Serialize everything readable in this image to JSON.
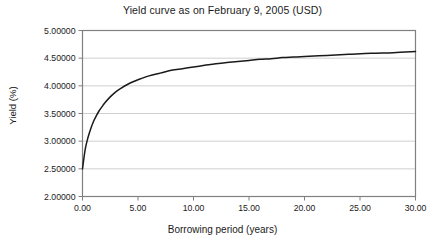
{
  "chart_data": {
    "type": "line",
    "title": "Yield curve as on February 9, 2005 (USD)",
    "xlabel": "Borrowing period (years)",
    "ylabel": "Yield (%)",
    "xlim": [
      0.0,
      30.0
    ],
    "ylim": [
      2.0,
      5.0
    ],
    "xticks": [
      0.0,
      5.0,
      10.0,
      15.0,
      20.0,
      25.0,
      30.0
    ],
    "xtick_labels": [
      "0.00",
      "5.00",
      "10.00",
      "15.00",
      "20.00",
      "25.00",
      "30.00"
    ],
    "yticks": [
      2.0,
      2.5,
      3.0,
      3.5,
      4.0,
      4.5,
      5.0
    ],
    "ytick_labels": [
      "2.00000",
      "2.50000",
      "3.00000",
      "3.50000",
      "4.00000",
      "4.50000",
      "5.00000"
    ],
    "grid": "horizontal",
    "legend": "none",
    "line_color": "#1a1a1a",
    "grid_color": "#cfcfcf",
    "axis_color": "#808080",
    "background_color": "#ffffff",
    "series": [
      {
        "name": "Yield curve",
        "x": [
          0.0,
          0.25,
          0.5,
          0.75,
          1.0,
          1.25,
          1.5,
          1.75,
          2.0,
          2.5,
          3.0,
          3.5,
          4.0,
          4.5,
          5.0,
          6.0,
          7.0,
          8.0,
          9.0,
          10.0,
          11.0,
          12.0,
          13.0,
          14.0,
          15.0,
          16.0,
          17.0,
          18.0,
          19.0,
          20.0,
          22.0,
          24.0,
          26.0,
          28.0,
          30.0
        ],
        "y": [
          2.5,
          2.86,
          3.07,
          3.23,
          3.36,
          3.46,
          3.55,
          3.62,
          3.69,
          3.8,
          3.89,
          3.96,
          4.02,
          4.07,
          4.11,
          4.18,
          4.23,
          4.28,
          4.31,
          4.34,
          4.37,
          4.4,
          4.42,
          4.44,
          4.46,
          4.48,
          4.49,
          4.51,
          4.52,
          4.53,
          4.55,
          4.57,
          4.59,
          4.6,
          4.62
        ]
      }
    ]
  }
}
